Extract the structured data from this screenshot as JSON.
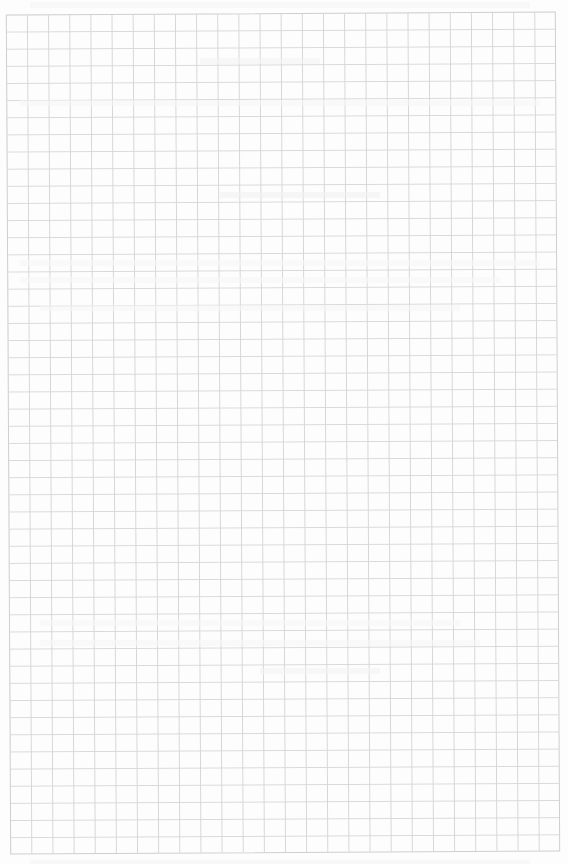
{
  "page": {
    "type": "graph-paper-sheet",
    "grid": {
      "columns": 26,
      "rows": 49,
      "line_color": "#d6d6d6",
      "paper_color": "#fdfdfd"
    },
    "content": {
      "legible_text": [],
      "note": "Faint reverse-side show-through only; no legible text"
    }
  }
}
